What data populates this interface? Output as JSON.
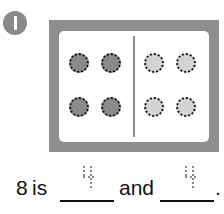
{
  "problem": {
    "number_badge": "1",
    "ten_frame": {
      "left_group": {
        "count": 4,
        "shade": "dark",
        "color": "#8a8a8a"
      },
      "right_group": {
        "count": 4,
        "shade": "light",
        "color": "#d4d4d4"
      }
    },
    "sentence": {
      "total": "8",
      "word_is": "is",
      "answer_1": "4",
      "word_and": "and",
      "answer_2": "4",
      "period": "."
    }
  },
  "colors": {
    "frame": "#8e8e8e",
    "badge": "#8a8a8a"
  }
}
